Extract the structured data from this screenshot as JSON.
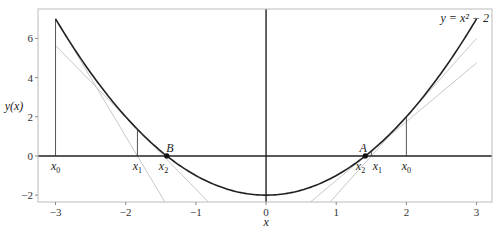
{
  "chart_data": {
    "type": "line",
    "title": "",
    "xlabel": "x",
    "ylabel": "y(x)",
    "xlim": [
      -3.25,
      3.22
    ],
    "ylim": [
      -2.35,
      7.5
    ],
    "xticks": [
      -3,
      -2,
      -1,
      0,
      1,
      2,
      3
    ],
    "yticks": [
      -2,
      0,
      2,
      4,
      6
    ],
    "grid": false,
    "legend": null,
    "curve": {
      "name": "y = x^2 - 2",
      "label": "y = x² − 2",
      "x_range": [
        -3,
        3
      ],
      "color": "#222222"
    },
    "tangent_lines": [
      {
        "at_x": -3,
        "slope": -6,
        "intercept": -11,
        "color": "#c8c8c8"
      },
      {
        "at_x": -1.833,
        "slope": -3.667,
        "intercept": -5.361,
        "color": "#c8c8c8"
      },
      {
        "at_x": 2,
        "slope": 4,
        "intercept": -6,
        "color": "#c8c8c8"
      },
      {
        "at_x": 1.5,
        "slope": 3,
        "intercept": -4.25,
        "color": "#c8c8c8"
      }
    ],
    "vertical_segments": [
      {
        "x": -3,
        "y_top": 7
      },
      {
        "x": -1.833,
        "y_top": 1.361
      },
      {
        "x": 2,
        "y_top": 2
      },
      {
        "x": 1.5,
        "y_top": 0.25
      }
    ],
    "iterate_labels": [
      {
        "text": "x0",
        "sub": "0",
        "x": -3
      },
      {
        "text": "x1",
        "sub": "1",
        "x": -1.833
      },
      {
        "text": "x2",
        "sub": "2",
        "x": -1.462
      },
      {
        "text": "x0",
        "sub": "0",
        "x": 2
      },
      {
        "text": "x1",
        "sub": "1",
        "x": 1.5
      },
      {
        "text": "x2",
        "sub": "2",
        "x": 1.4167
      }
    ],
    "roots": [
      {
        "label": "B",
        "x": -1.4142,
        "y": 0
      },
      {
        "label": "A",
        "x": 1.4142,
        "y": 0
      }
    ]
  }
}
